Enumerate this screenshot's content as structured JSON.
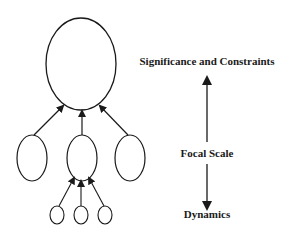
{
  "diagram": {
    "hierarchy": {
      "top_node": {
        "shape": "ellipse",
        "cx": 81,
        "cy": 64,
        "rx": 35,
        "ry": 46
      },
      "middle_nodes": [
        {
          "cx": 32,
          "cy": 158,
          "rx": 15,
          "ry": 23
        },
        {
          "cx": 82,
          "cy": 158,
          "rx": 15,
          "ry": 23
        },
        {
          "cx": 130,
          "cy": 158,
          "rx": 15,
          "ry": 23
        }
      ],
      "bottom_nodes": [
        {
          "cx": 57,
          "cy": 215,
          "rx": 7,
          "ry": 9
        },
        {
          "cx": 81,
          "cy": 215,
          "rx": 7,
          "ry": 9
        },
        {
          "cx": 105,
          "cy": 215,
          "rx": 7,
          "ry": 9
        }
      ],
      "edge_direction": "upward"
    },
    "scale_axis": {
      "top_label": "Significance and Constraints",
      "center_label": "Focal Scale",
      "bottom_label": "Dynamics"
    },
    "colors": {
      "stroke": "#1a1a1a",
      "background": "#ffffff"
    }
  }
}
